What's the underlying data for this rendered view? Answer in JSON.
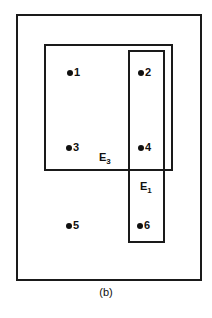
{
  "figure": {
    "caption": "(b)",
    "stroke_color": "#1a1a1a",
    "background_color": "#ffffff",
    "outer_region": {
      "name": "universe-box"
    },
    "regions": [
      {
        "id": "E3",
        "base": "E",
        "subscript": "3",
        "label_x": 99,
        "label_y": 152
      },
      {
        "id": "E1",
        "base": "E",
        "subscript": "1",
        "label_x": 140,
        "label_y": 181
      }
    ],
    "points": [
      {
        "label": "1",
        "x": 67,
        "y": 67
      },
      {
        "label": "2",
        "x": 138,
        "y": 67
      },
      {
        "label": "3",
        "x": 66,
        "y": 142
      },
      {
        "label": "4",
        "x": 138,
        "y": 142
      },
      {
        "label": "5",
        "x": 66,
        "y": 220
      },
      {
        "label": "6",
        "x": 137,
        "y": 220
      }
    ]
  }
}
